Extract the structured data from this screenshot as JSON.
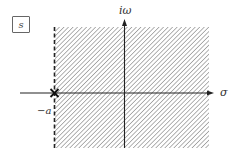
{
  "diagram": {
    "plane_label": "s",
    "vertical_axis_label": "iω",
    "horizontal_axis_label": "σ",
    "pole_label": "−a",
    "pole_marker": "x-marker",
    "region": "Re(s) > −a (shaded region of convergence)",
    "boundary_style": "dashed",
    "colors": {
      "axis": "#222222",
      "hatch": "#8a8a8a",
      "text": "#333333"
    }
  }
}
